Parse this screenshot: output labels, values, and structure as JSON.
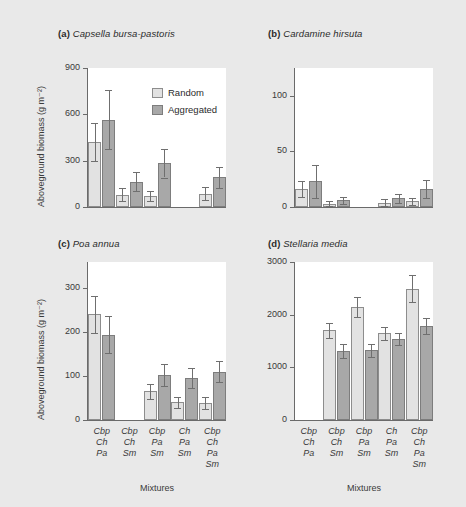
{
  "figure": {
    "background": "#e9e9e9",
    "xaxis_title": "Mixtures",
    "yaxis_title": "Aboveground biomass (g m⁻²)",
    "legend": {
      "items": [
        {
          "label": "Random",
          "color": "#e2e2e2"
        },
        {
          "label": "Aggregated",
          "color": "#a8a8a8"
        }
      ]
    },
    "categories": [
      {
        "lines": [
          "Cbp",
          "Ch",
          "Pa"
        ]
      },
      {
        "lines": [
          "Cbp",
          "Ch",
          "Sm"
        ]
      },
      {
        "lines": [
          "Cbp",
          "Pa",
          "Sm"
        ]
      },
      {
        "lines": [
          "Ch",
          "Pa",
          "Sm"
        ]
      },
      {
        "lines": [
          "Cbp",
          "Ch",
          "Pa",
          "Sm"
        ]
      }
    ]
  },
  "chart_data": [
    {
      "type": "bar",
      "panel": "a",
      "panel_letter": "(a)",
      "title": "Capsella bursa-pastoris",
      "xlabel": "Mixtures",
      "ylabel": "Aboveground biomass (g m⁻²)",
      "ylim": [
        0,
        900
      ],
      "yticks": [
        0,
        300,
        600,
        900
      ],
      "grid": false,
      "legend_position": "top-right",
      "categories": [
        "Cbp Ch Pa",
        "Cbp Ch Sm",
        "Cbp Pa Sm",
        "Ch Pa Sm",
        "Cbp Ch Pa Sm"
      ],
      "series": [
        {
          "name": "Random",
          "values": [
            420,
            80,
            70,
            null,
            85
          ],
          "errors": [
            125,
            40,
            32,
            null,
            42
          ]
        },
        {
          "name": "Aggregated",
          "values": [
            565,
            165,
            283,
            null,
            192
          ],
          "errors": [
            190,
            60,
            92,
            null,
            68
          ]
        }
      ]
    },
    {
      "type": "bar",
      "panel": "b",
      "panel_letter": "(b)",
      "title": "Cardamine hirsuta",
      "xlabel": "Mixtures",
      "ylabel": "Aboveground biomass (g m⁻²)",
      "ylim": [
        0,
        125
      ],
      "yticks": [
        0,
        50,
        100
      ],
      "grid": false,
      "legend_position": "none",
      "categories": [
        "Cbp Ch Pa",
        "Cbp Ch Sm",
        "Cbp Pa Sm",
        "Ch Pa Sm",
        "Cbp Ch Pa Sm"
      ],
      "series": [
        {
          "name": "Random",
          "values": [
            16,
            3,
            null,
            4,
            5
          ],
          "errors": [
            7,
            2,
            null,
            3,
            3
          ]
        },
        {
          "name": "Aggregated",
          "values": [
            23,
            6,
            null,
            8,
            16
          ],
          "errors": [
            15,
            3,
            null,
            4,
            8
          ]
        }
      ]
    },
    {
      "type": "bar",
      "panel": "c",
      "panel_letter": "(c)",
      "title": "Poa annua",
      "xlabel": "Mixtures",
      "ylabel": "Aboveground biomass (g m⁻²)",
      "ylim": [
        0,
        360
      ],
      "yticks": [
        0,
        100,
        200,
        300
      ],
      "grid": false,
      "legend_position": "none",
      "categories": [
        "Cbp Ch Pa",
        "Cbp Ch Sm",
        "Cbp Pa Sm",
        "Ch Pa Sm",
        "Cbp Ch Pa Sm"
      ],
      "series": [
        {
          "name": "Random",
          "values": [
            241,
            null,
            65,
            40,
            39
          ],
          "errors": [
            42,
            null,
            18,
            13,
            13
          ]
        },
        {
          "name": "Aggregated",
          "values": [
            194,
            null,
            102,
            95,
            110
          ],
          "errors": [
            42,
            null,
            25,
            23,
            24
          ]
        }
      ]
    },
    {
      "type": "bar",
      "panel": "d",
      "panel_letter": "(d)",
      "title": "Stellaria media",
      "xlabel": "Mixtures",
      "ylabel": "Aboveground biomass (g m⁻²)",
      "ylim": [
        0,
        3000
      ],
      "yticks": [
        0,
        1000,
        2000,
        3000
      ],
      "grid": false,
      "legend_position": "none",
      "categories": [
        "Cbp Ch Pa",
        "Cbp Ch Sm",
        "Cbp Pa Sm",
        "Ch Pa Sm",
        "Cbp Ch Pa Sm"
      ],
      "series": [
        {
          "name": "Random",
          "values": [
            null,
            1700,
            2150,
            1650,
            2490
          ],
          "errors": [
            null,
            140,
            185,
            125,
            255
          ]
        },
        {
          "name": "Aggregated",
          "values": [
            null,
            1310,
            1320,
            1540,
            1780
          ],
          "errors": [
            null,
            135,
            130,
            115,
            150
          ]
        }
      ]
    }
  ]
}
